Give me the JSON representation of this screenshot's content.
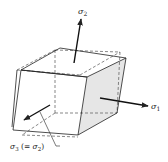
{
  "diagram": {
    "type": "stress-state-cube",
    "labels": {
      "sigma2": {
        "symbol": "σ",
        "subscript": "2"
      },
      "sigma1": {
        "symbol": "σ",
        "subscript": "1"
      },
      "sigma3": {
        "symbol": "σ",
        "subscript": "3",
        "suffix_open": " (= ",
        "suffix_symbol": "σ",
        "suffix_subscript": "2",
        "suffix_close": ")"
      }
    },
    "colors": {
      "line": "#222222",
      "dashed": "#555555",
      "shaded_face": "#e6e6e6",
      "background": "#ffffff"
    }
  }
}
